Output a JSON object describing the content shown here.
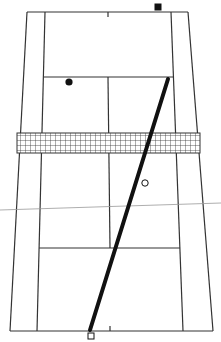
{
  "diagram": {
    "type": "tennis-court-perspective",
    "colors": {
      "background": "#ffffff",
      "court_lines": "#333333",
      "net_mesh": "#333333",
      "shot_path": "#111111",
      "horizon_line": "#999999",
      "markers": "#111111"
    },
    "court": {
      "far_baseline": {
        "left": 27,
        "right": 188,
        "y": 12
      },
      "near_baseline": {
        "left": 10,
        "right": 213,
        "y": 331
      },
      "far_singles": {
        "left": 45,
        "right": 171
      },
      "near_singles": {
        "left": 37,
        "right": 183
      },
      "far_service_line_y": 77,
      "near_service_line_y": 248,
      "center_line": {
        "x_top": 108,
        "x_bottom": 110
      }
    },
    "net": {
      "x": 17,
      "y": 133,
      "width": 183,
      "height": 20
    },
    "markers": [
      {
        "name": "far-player",
        "shape": "filled-square",
        "x": 158,
        "y": 7
      },
      {
        "name": "ball-bounce",
        "shape": "filled-circle",
        "x": 69,
        "y": 82
      },
      {
        "name": "target-point",
        "shape": "open-circle",
        "x": 145,
        "y": 183
      },
      {
        "name": "near-player",
        "shape": "open-square",
        "x": 91,
        "y": 336
      }
    ],
    "shot_path": {
      "x1": 168,
      "y1": 79,
      "x2": 90,
      "y2": 330
    },
    "horizon_line": {
      "x1": 0,
      "y1": 210,
      "x2": 221,
      "y2": 203
    }
  }
}
